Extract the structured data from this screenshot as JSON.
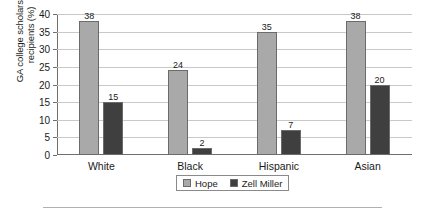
{
  "chart_data": {
    "type": "bar",
    "title": "",
    "xlabel": "",
    "ylabel": "GA college scholarship\nrecipients (%)",
    "categories": [
      "White",
      "Black",
      "Hispanic",
      "Asian"
    ],
    "series": [
      {
        "name": "Hope",
        "color": "#a9a9a9",
        "values": [
          38,
          24,
          35,
          38
        ]
      },
      {
        "name": "Zell Miller",
        "color": "#3f3f3f",
        "values": [
          15,
          2,
          7,
          20
        ]
      }
    ],
    "ylim": [
      0,
      40
    ],
    "yticks": [
      0,
      5,
      10,
      15,
      20,
      25,
      30,
      35,
      40
    ],
    "ytick_labels": [
      "0",
      "5",
      "10",
      "15",
      "20",
      "25",
      "30",
      "35",
      "40"
    ],
    "grid": "horizontal",
    "legend_position": "bottom-center",
    "data_labels": true
  },
  "legend": {
    "items": [
      {
        "label": "Hope",
        "color": "#a9a9a9"
      },
      {
        "label": "Zell Miller",
        "color": "#3f3f3f"
      }
    ]
  }
}
